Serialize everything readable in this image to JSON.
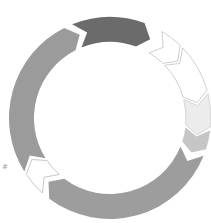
{
  "diagram": {
    "type": "cycle",
    "center": [
      110,
      118
    ],
    "outer_radius": 101,
    "inner_radius": 76,
    "segments": [
      {
        "name": "segment-left-arc",
        "start": 148,
        "end": 243,
        "fill": "#9b9b9b",
        "stroke": "none",
        "head": 7,
        "notch": 7
      },
      {
        "name": "segment-top-dark",
        "start": 248,
        "end": 290,
        "fill": "#6b6b6b",
        "stroke": "none",
        "head": 7,
        "notch": 7
      },
      {
        "name": "segment-chevron-small-white",
        "start": 301,
        "end": 314,
        "fill": "#ffffff",
        "stroke": "#cfcfcf",
        "head": 6,
        "notch": 6
      },
      {
        "name": "segment-arrow-white",
        "start": 316,
        "end": 344,
        "fill": "#ffffff",
        "stroke": "#cfcfcf",
        "head": 6,
        "notch": 6
      },
      {
        "name": "segment-arrow-lightgray",
        "start": 346,
        "end": 365,
        "fill": "#ececec",
        "stroke": "#d6d6d6",
        "head": 6,
        "notch": 6
      },
      {
        "name": "segment-chevron-midgray",
        "start": 367,
        "end": 378,
        "fill": "#c6c6c6",
        "stroke": "none",
        "head": 5,
        "notch": 5
      },
      {
        "name": "segment-bottom-arc",
        "start": 382,
        "end": 487,
        "fill": "#9d9d9d",
        "stroke": "none",
        "head": 7,
        "notch": 7
      },
      {
        "name": "segment-chevron-white-lowerleft",
        "start": 492,
        "end": 506,
        "fill": "#ffffff",
        "stroke": "#c8c8c8",
        "head": 6,
        "notch": 6
      }
    ]
  },
  "marks": {
    "left_glyph": "#"
  }
}
